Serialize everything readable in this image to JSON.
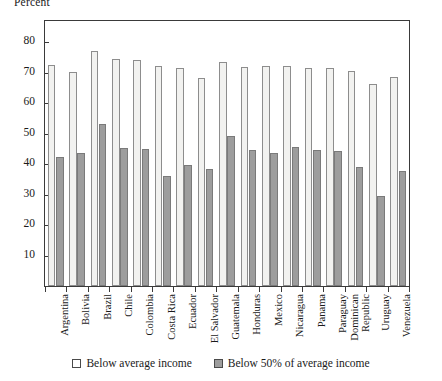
{
  "chart_data": {
    "type": "bar",
    "title": "",
    "xlabel": "",
    "ylabel": "Percent",
    "ylim": [
      0,
      87
    ],
    "yticks": [
      10,
      20,
      30,
      40,
      50,
      60,
      70,
      80
    ],
    "grid": false,
    "legend_position": "bottom",
    "categories": [
      "Argentina",
      "Bolivia",
      "Brazil",
      "Chile",
      "Colombia",
      "Costa Rica",
      "Ecuador",
      "El Salvador",
      "Guatemala",
      "Honduras",
      "Mexico",
      "Nicaragua",
      "Panama",
      "Paraguay",
      "Dominican Republic",
      "Uruguay",
      "Venezuela"
    ],
    "series": [
      {
        "name": "Below average income",
        "color": "#f2f2f0",
        "values": [
          72.5,
          70.3,
          77.0,
          74.5,
          74.2,
          72.3,
          71.5,
          68.2,
          73.5,
          72.0,
          72.3,
          72.3,
          71.5,
          71.5,
          70.5,
          66.2,
          68.7
        ]
      },
      {
        "name": "Below 50% of average income",
        "color": "#9d9d9d",
        "values": [
          42.3,
          43.7,
          53.2,
          45.2,
          45.0,
          36.0,
          39.8,
          38.5,
          49.3,
          44.5,
          43.7,
          45.5,
          44.5,
          44.2,
          39.2,
          29.7,
          37.8
        ]
      }
    ],
    "legend": [
      {
        "label": "Below average income",
        "swatch": "light"
      },
      {
        "label": "Below 50% of average income",
        "swatch": "dark"
      }
    ]
  }
}
